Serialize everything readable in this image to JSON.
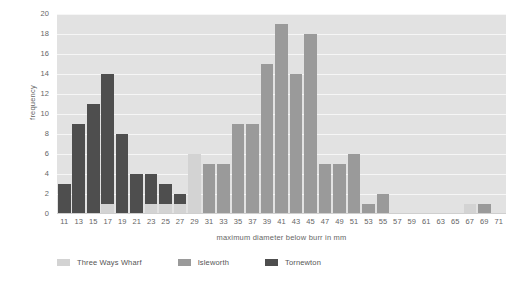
{
  "chart_data": {
    "type": "bar",
    "subtype": "stacked-histogram",
    "title": "",
    "xlabel": "maximum diameter below burr in mm",
    "ylabel": "frequency",
    "ylim": [
      0,
      20
    ],
    "ytick_step": 2,
    "yticks": [
      "20",
      "18",
      "16",
      "14",
      "12",
      "10",
      "8",
      "6",
      "4",
      "2",
      "0"
    ],
    "grid": true,
    "legend_position": "bottom",
    "categories": [
      "11",
      "13",
      "15",
      "17",
      "19",
      "21",
      "23",
      "25",
      "27",
      "29",
      "31",
      "33",
      "35",
      "37",
      "39",
      "41",
      "43",
      "45",
      "47",
      "49",
      "51",
      "53",
      "55",
      "57",
      "59",
      "61",
      "63",
      "65",
      "67",
      "69",
      "71"
    ],
    "series": [
      {
        "name": "Three Ways Wharf",
        "color": "#d3d3d3",
        "values": [
          0,
          0,
          0,
          1,
          0,
          0,
          1,
          1,
          1,
          6,
          0,
          0,
          0,
          0,
          0,
          0,
          0,
          0,
          0,
          0,
          0,
          0,
          0,
          0,
          0,
          0,
          0,
          0,
          1,
          0,
          0
        ]
      },
      {
        "name": "Isleworth",
        "color": "#9a9a9a",
        "values": [
          0,
          0,
          0,
          0,
          0,
          0,
          0,
          0,
          0,
          0,
          5,
          5,
          9,
          9,
          15,
          19,
          14,
          18,
          5,
          5,
          6,
          1,
          2,
          0,
          0,
          0,
          0,
          0,
          0,
          1,
          0
        ]
      },
      {
        "name": "Tornewton",
        "color": "#4e4e4e",
        "values": [
          3,
          9,
          11,
          13,
          8,
          4,
          3,
          2,
          1,
          0,
          0,
          0,
          0,
          0,
          0,
          0,
          0,
          0,
          0,
          0,
          0,
          0,
          0,
          0,
          0,
          0,
          0,
          0,
          0,
          0,
          0
        ]
      }
    ],
    "totals": [
      3,
      9,
      11,
      14,
      8,
      4,
      4,
      3,
      2,
      6,
      5,
      5,
      9,
      9,
      15,
      19,
      14,
      18,
      5,
      5,
      6,
      1,
      2,
      0,
      0,
      0,
      0,
      0,
      1,
      1,
      0
    ]
  },
  "colors": {
    "plot_background": "#e2e2e2",
    "gridline": "#f6f6f6",
    "page_background": "#ffffff",
    "axis_text": "#666666",
    "legend_text": "#555555"
  }
}
